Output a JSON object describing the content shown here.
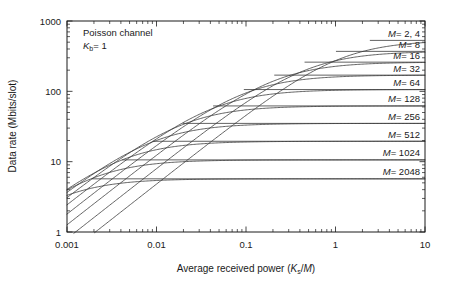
{
  "chart_data": {
    "type": "line",
    "title": "",
    "xlabel": "Average received power (Ks/M)",
    "xlabel_parts": {
      "main": "Average received power (",
      "italic1": "K",
      "sub1": "s",
      "mid": "/",
      "italic2": "M",
      "tail": ")"
    },
    "ylabel": "Data rate (Mbits/slot)",
    "xscale": "log",
    "yscale": "log",
    "xlim": [
      0.001,
      10
    ],
    "ylim": [
      1,
      1000
    ],
    "xticks": [
      "0.001",
      "0.01",
      "0.1",
      "1",
      "10"
    ],
    "xtick_values": [
      0.001,
      0.01,
      0.1,
      1,
      10
    ],
    "yticks": [
      "1",
      "10",
      "100",
      "1000"
    ],
    "ytick_values": [
      1,
      10,
      100,
      1000
    ],
    "grid": false,
    "legend_position": "inline-right-labels",
    "annotations": [
      {
        "text": "Poisson channel",
        "x": 0.0016,
        "y": 560
      },
      {
        "text": "Kb = 1",
        "italic": "K",
        "sub": "b",
        "rest": "= 1",
        "x": 0.0016,
        "y": 400
      }
    ],
    "series": [
      {
        "name": "M = 2, 4",
        "label": "M = 2, 4",
        "M": 4,
        "plateau": 530.0,
        "knee_x": 1.1
      },
      {
        "name": "M = 8",
        "label": "M = 8",
        "M": 8,
        "plateau": 370.0,
        "knee_x": 0.46
      },
      {
        "name": "M = 16",
        "label": "M = 16",
        "M": 16,
        "plateau": 260.0,
        "knee_x": 0.205
      },
      {
        "name": "M = 32",
        "label": "M = 32",
        "M": 32,
        "plateau": 170.0,
        "knee_x": 0.094
      },
      {
        "name": "M = 64",
        "label": "M = 64",
        "M": 64,
        "plateau": 106.0,
        "knee_x": 0.043
      },
      {
        "name": "M = 128",
        "label": "M = 128",
        "M": 128,
        "plateau": 62.0,
        "knee_x": 0.0195
      },
      {
        "name": "M = 256",
        "label": "M = 256",
        "M": 256,
        "plateau": 35.0,
        "knee_x": 0.0089
      },
      {
        "name": "M = 512",
        "label": "M = 512",
        "M": 512,
        "plateau": 19.5,
        "knee_x": 0.0041
      },
      {
        "name": "M = 1024",
        "label": "M = 1024",
        "M": 1024,
        "plateau": 10.6,
        "knee_x": 0.00188
      },
      {
        "name": "M = 2048",
        "label": "M = 2048",
        "M": 2048,
        "plateau": 5.7,
        "knee_x": 0.00086
      }
    ],
    "series_labels": [
      "M = 2, 4",
      "M = 8",
      "M = 16",
      "M = 32",
      "M = 64",
      "M = 128",
      "M = 256",
      "M = 512",
      "M = 1024",
      "M = 2048"
    ]
  },
  "labels": {
    "ytick_1000": "1000",
    "ytick_100": "100",
    "ytick_10": "10",
    "ytick_1": "1",
    "xtick_0001": "0.001",
    "xtick_001": "0.01",
    "xtick_01": "0.1",
    "xtick_1": "1",
    "xtick_10": "10",
    "annot_line1": "Poisson channel",
    "annot_kb_italic": "K",
    "annot_kb_sub": "b",
    "annot_kb_rest": "= 1",
    "ytitle": "Data rate (Mbits/slot)",
    "xtitle_main": "Average received power (",
    "xtitle_ks_italic": "K",
    "xtitle_ks_sub": "s",
    "xtitle_slash": "/",
    "xtitle_m_italic": "M",
    "xtitle_close": ")",
    "m_italic": "M",
    "m_eq_2_4": "= 2, 4",
    "m_eq_8": "= 8",
    "m_eq_16": "= 16",
    "m_eq_32": "= 32",
    "m_eq_64": "= 64",
    "m_eq_128": "= 128",
    "m_eq_256": "= 256",
    "m_eq_512": "= 512",
    "m_eq_1024": "= 1024",
    "m_eq_2048": "= 2048"
  },
  "colors": {
    "axis": "#1a1a1a",
    "curve": "#3a3a3a",
    "background": "#ffffff"
  }
}
